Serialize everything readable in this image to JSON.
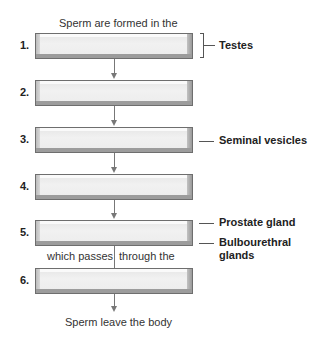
{
  "diagram": {
    "top_caption": "Sperm are formed in the",
    "bottom_caption": "Sperm leave the body",
    "mid_caption_left": "which passes",
    "mid_caption_right": "through the",
    "steps": [
      {
        "number": "1.",
        "content": ""
      },
      {
        "number": "2.",
        "content": ""
      },
      {
        "number": "3.",
        "content": ""
      },
      {
        "number": "4.",
        "content": ""
      },
      {
        "number": "5.",
        "content": ""
      },
      {
        "number": "6.",
        "content": ""
      }
    ],
    "labels": {
      "testes": "Testes",
      "seminal_vesicles": "Seminal vesicles",
      "prostate_gland": "Prostate gland",
      "bulbourethral_line1": "Bulbourethral",
      "bulbourethral_line2": "glands"
    },
    "colors": {
      "box_fill": "#ececec",
      "box_border": "#6e6e6e",
      "arrow": "#777777",
      "text": "#222222"
    }
  }
}
